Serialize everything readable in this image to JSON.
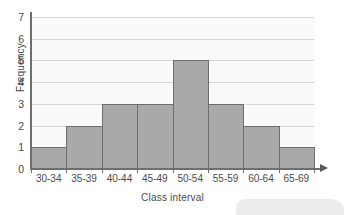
{
  "chart_data": {
    "type": "bar",
    "title": "",
    "subtitle": "",
    "xlabel": "Class interval",
    "ylabel": "Frequency",
    "categories": [
      "30-34",
      "35-39",
      "40-44",
      "45-49",
      "50-54",
      "55-59",
      "60-64",
      "65-69"
    ],
    "values": [
      1,
      2,
      3,
      3,
      5,
      3,
      2,
      1
    ],
    "ylim": [
      0,
      7
    ],
    "yticks": [
      0,
      1,
      2,
      3,
      4,
      5,
      6,
      7
    ],
    "ytick_labels": [
      "0",
      "1",
      "2",
      "3",
      "4",
      "5",
      "6",
      "7"
    ],
    "grid": true,
    "grid_axis": "y",
    "legend": false,
    "legend_position": "none",
    "bar_gap": 0,
    "colors": {
      "bar_fill": "#a9a9a9",
      "bar_border": "#6e6e6e",
      "gridline": "#d6d6d6",
      "axis": "#6e6e6e",
      "plot_background": "#fafafa",
      "figure_background": "#ffffff",
      "text": "#4a4a4a"
    }
  },
  "axes": {
    "x_arrow_icon": "arrow-right-icon"
  }
}
